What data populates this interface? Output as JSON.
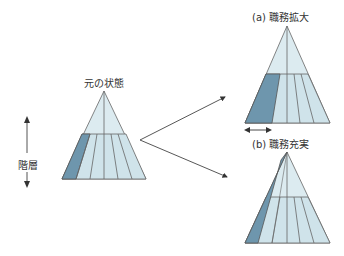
{
  "labels": {
    "original": "元の状態",
    "hierarchy": "階層",
    "enlargement": "(a) 職務拡大",
    "enrichment": "(b) 職務充実"
  },
  "colors": {
    "light_fill": "#dcebf0",
    "mid_fill": "#cfe3ea",
    "dark_fill": "#6e96ad",
    "stroke": "#555555"
  }
}
